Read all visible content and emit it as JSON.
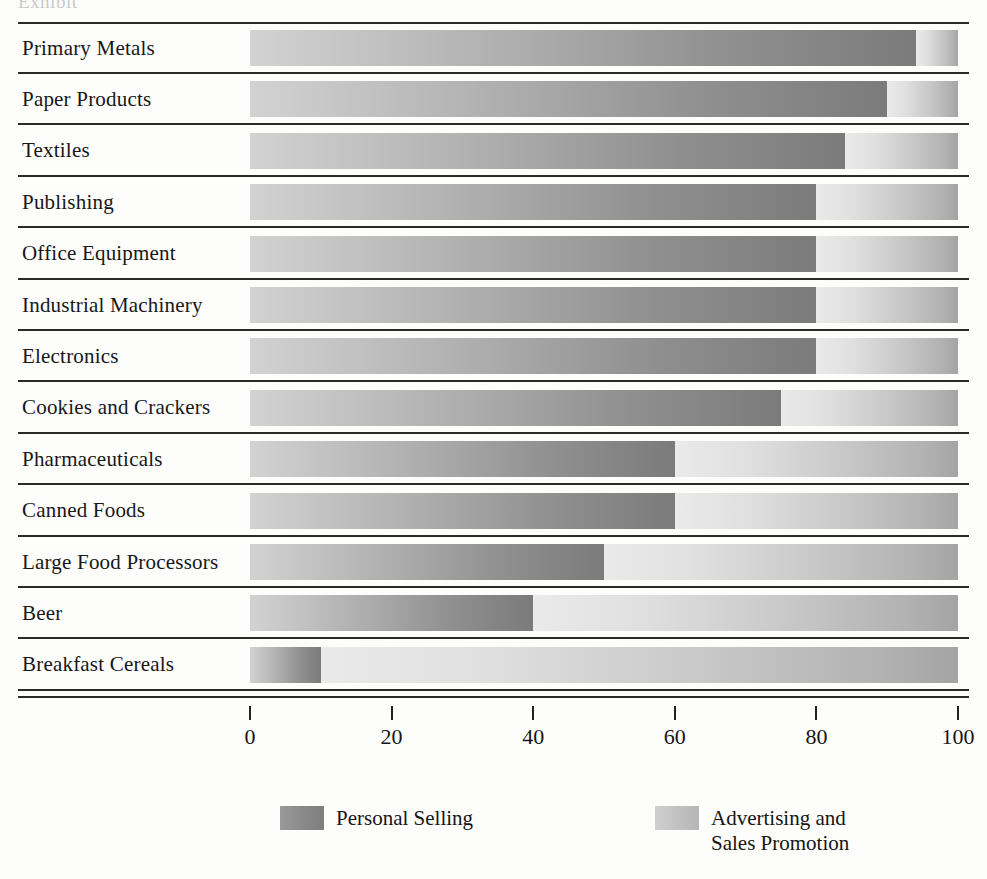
{
  "top_ghost_text": "Exhibit",
  "chart_data": {
    "type": "bar",
    "orientation": "horizontal",
    "stacked": true,
    "normalized_percent": true,
    "title": "",
    "xlabel": "",
    "ylabel": "",
    "xlim": [
      0,
      100
    ],
    "xticks": [
      "0",
      "20",
      "40",
      "60",
      "80",
      "100"
    ],
    "xtick_values": [
      0,
      20,
      40,
      60,
      80,
      100
    ],
    "grid": false,
    "legend_position": "bottom",
    "categories": [
      "Primary Metals",
      "Paper Products",
      "Textiles",
      "Publishing",
      "Office Equipment",
      "Industrial Machinery",
      "Electronics",
      "Cookies and Crackers",
      "Pharmaceuticals",
      "Canned Foods",
      "Large Food Processors",
      "Beer",
      "Breakfast Cereals"
    ],
    "series": [
      {
        "name": "Personal Selling",
        "color": "#8a8a8a",
        "values": [
          94,
          90,
          84,
          80,
          80,
          80,
          80,
          75,
          60,
          60,
          50,
          40,
          10
        ]
      },
      {
        "name": "Advertising and Sales Promotion",
        "color": "#c4c4c4",
        "values": [
          6,
          10,
          16,
          20,
          20,
          20,
          20,
          25,
          40,
          40,
          50,
          60,
          90
        ]
      }
    ]
  },
  "legend": {
    "items": [
      {
        "label": "Personal Selling",
        "line1": "Personal Selling",
        "line2": ""
      },
      {
        "label": "Advertising and Sales Promotion",
        "line1": "Advertising and",
        "line2": "Sales Promotion"
      }
    ]
  },
  "icons": {
    "legend_swatch_personal": "swatch-dark-gray",
    "legend_swatch_advert": "swatch-light-gray"
  }
}
